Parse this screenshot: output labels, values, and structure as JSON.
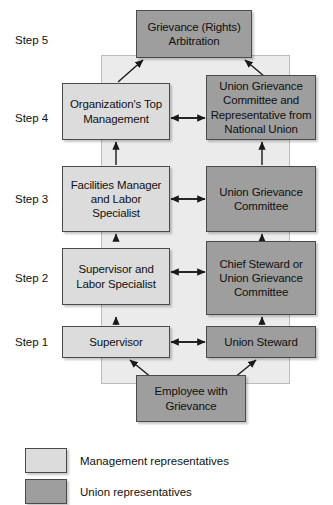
{
  "diagram": {
    "colors": {
      "management_fill": "#dcdcdc",
      "union_fill": "#9e9e9e",
      "backdrop_fill": "#ebebeb",
      "border": "#4a4a4a",
      "text": "#111111"
    },
    "steps": [
      {
        "id": "step5",
        "label": "Step 5"
      },
      {
        "id": "step4",
        "label": "Step 4"
      },
      {
        "id": "step3",
        "label": "Step 3"
      },
      {
        "id": "step2",
        "label": "Step 2"
      },
      {
        "id": "step1",
        "label": "Step 1"
      }
    ],
    "nodes": {
      "arbitration": {
        "text": "Grievance (Rights) Arbitration",
        "side": "union"
      },
      "top_management": {
        "text": "Organization's Top Management",
        "side": "management"
      },
      "union_committee_rep": {
        "text": "Union Grievance Committee and Representative from National Union",
        "side": "union"
      },
      "facilities_manager": {
        "text": "Facilities Manager and Labor Specialist",
        "side": "management"
      },
      "union_committee": {
        "text": "Union Grievance Committee",
        "side": "union"
      },
      "supervisor_labor": {
        "text": "Supervisor and Labor Specialist",
        "side": "management"
      },
      "chief_steward": {
        "text": "Chief Steward or Union Grievance Committee",
        "side": "union"
      },
      "supervisor": {
        "text": "Supervisor",
        "side": "management"
      },
      "union_steward": {
        "text": "Union Steward",
        "side": "union"
      },
      "employee": {
        "text": "Employee with Grievance",
        "side": "union"
      }
    },
    "legend": [
      {
        "swatch": "management",
        "text": "Management representatives"
      },
      {
        "swatch": "union",
        "text": "Union representatives"
      }
    ]
  }
}
